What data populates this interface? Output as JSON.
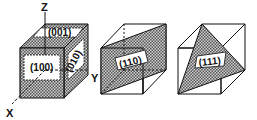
{
  "figure": {
    "axes": {
      "x": "X",
      "y": "Y",
      "z": "Z"
    },
    "cubes": [
      {
        "planes": [
          "(100)",
          "(010)",
          "(001)"
        ]
      },
      {
        "planes": [
          "(110)"
        ]
      },
      {
        "planes": [
          "(111)"
        ]
      }
    ]
  },
  "colors": {
    "line": "#111111",
    "hatch": "#888888",
    "background": "#ffffff"
  }
}
